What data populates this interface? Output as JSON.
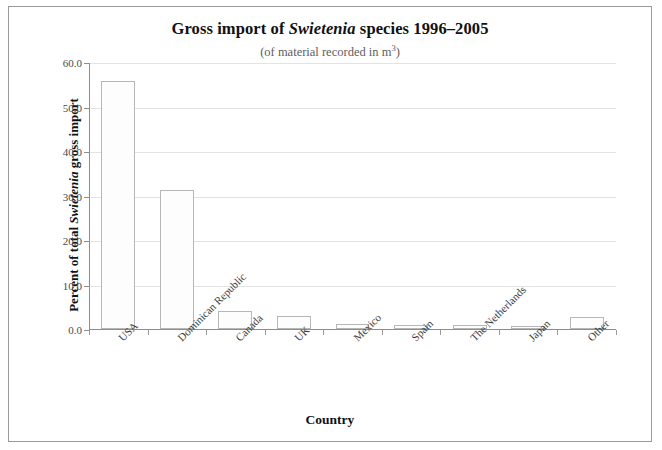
{
  "chart_data": {
    "type": "bar",
    "title": "Gross import of Swietenia species 1996–2005",
    "title_pre": "Gross import of ",
    "title_italic": "Swietenia",
    "title_post": " species 1996–2005",
    "subtitle_pre": "(of material recorded in m",
    "subtitle_sup": "3",
    "subtitle_post": ")",
    "xlabel": "Country",
    "ylabel_pre": "Percent of total ",
    "ylabel_italic": "Swietenia",
    "ylabel_post": " gross import",
    "categories": [
      "USA",
      "Dominican Republic",
      "Canada",
      "UK",
      "Mexico",
      "Spain",
      "The Netherlands",
      "Japan",
      "Other"
    ],
    "values": [
      55.7,
      31.3,
      4.0,
      2.9,
      1.2,
      0.8,
      0.9,
      0.7,
      2.7
    ],
    "ylim": [
      0.0,
      60.0
    ],
    "ytick_labels": [
      "0.0",
      "10.0",
      "20.0",
      "30.0",
      "40.0",
      "50.0",
      "60.0"
    ],
    "ytick_values": [
      0,
      10,
      20,
      30,
      40,
      50,
      60
    ],
    "grid": true,
    "legend": "none",
    "bar_fill": "#fdfdfd",
    "bar_border": "#b7b7b7",
    "grid_color": "#e3e3e3",
    "axis_color": "#8d8d8d",
    "frame_color": "#9a9a9a"
  }
}
